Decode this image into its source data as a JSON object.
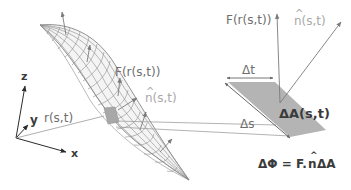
{
  "axes": {
    "z_label": "z",
    "y_label": "y",
    "x_label": "x"
  },
  "labels": {
    "position_vector": "r(s,t)",
    "field_on_surface": "F(r(s,t))",
    "normal_on_surface": "n(s,t)",
    "normal_hat": "^",
    "field_on_patch": "F(r(s,t))",
    "normal_on_patch": "n(s,t)",
    "delta_t": "Δt",
    "delta_s": "Δs",
    "area_element": "ΔA(s,t)",
    "flux_formula_left": "ΔΦ = F.",
    "flux_formula_n": "n",
    "flux_formula_right": "ΔA"
  },
  "colors": {
    "mesh": "#8c8c8c",
    "patch_fill": "#a8a8a8",
    "arrow": "#7a7a7a",
    "axis": "#2b2b2b",
    "light_text": "#a9a9a9",
    "dark_text": "#3a3a3a"
  }
}
